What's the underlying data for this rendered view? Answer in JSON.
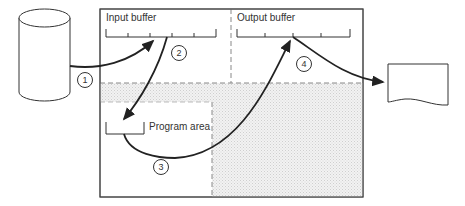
{
  "diagram": {
    "labels": {
      "input_buffer": "Input buffer",
      "output_buffer": "Output buffer",
      "program_area": "Program area"
    },
    "steps": [
      {
        "id": "1",
        "label": "1",
        "from": "disk",
        "to": "input_buffer"
      },
      {
        "id": "2",
        "label": "2",
        "from": "input_buffer",
        "to": "program_area"
      },
      {
        "id": "3",
        "label": "3",
        "from": "program_area",
        "to": "output_buffer"
      },
      {
        "id": "4",
        "label": "4",
        "from": "output_buffer",
        "to": "printed_document"
      }
    ],
    "nodes": {
      "disk": "cylinder-storage",
      "memory": "main-memory-box",
      "document": "printed-document"
    },
    "colors": {
      "line": "#222222",
      "shading": "#e6e6e6",
      "dash": "#888888"
    }
  }
}
